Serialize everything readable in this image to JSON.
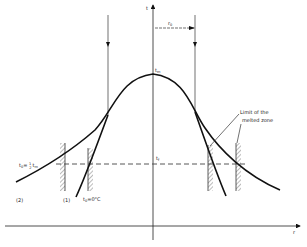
{
  "figure": {
    "axes": {
      "x_label": "r",
      "y_label": "t"
    },
    "labels": {
      "peak": "t",
      "peak_sub": "m",
      "center_level": "t",
      "center_level_sub": "f",
      "arrow_r0": "r",
      "arrow_r0_sub": "0",
      "t0_half_prefix": "t",
      "t0_half_sub": "0",
      "t0_half_eq": "= ",
      "t0_half_frac_num": "1",
      "t0_half_frac_den": "2",
      "t0_half_tm": "t",
      "t0_half_tm_sub": "m",
      "t0_zero_prefix": "t",
      "t0_zero_sub": "0",
      "t0_zero_eq": "=0°C",
      "curve1": "(1)",
      "curve2": "(2)",
      "annotation_line1": "Limit of the",
      "annotation_line2": "melted zone"
    },
    "colors": {
      "stroke": "#111111",
      "background": "#ffffff"
    }
  }
}
